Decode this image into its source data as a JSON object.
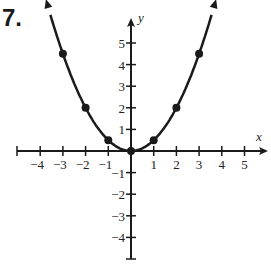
{
  "problem": {
    "number": "7."
  },
  "chart_data": {
    "type": "line",
    "title": "",
    "xlabel": "x",
    "ylabel": "y",
    "function": "y = x^2 / 2",
    "x_ticks": [
      -4,
      -3,
      -2,
      -1,
      1,
      2,
      3,
      4,
      5
    ],
    "y_ticks": [
      -4,
      -3,
      -2,
      -1,
      1,
      2,
      3,
      4,
      5
    ],
    "xlim": [
      -5,
      6
    ],
    "ylim": [
      -5,
      6
    ],
    "grid": false,
    "points": [
      {
        "x": -3,
        "y": 4.5
      },
      {
        "x": -2,
        "y": 2
      },
      {
        "x": -1,
        "y": 0.5
      },
      {
        "x": 0,
        "y": 0
      },
      {
        "x": 1,
        "y": 0.5
      },
      {
        "x": 2,
        "y": 2
      },
      {
        "x": 3,
        "y": 4.5
      }
    ],
    "curve_arrows": true,
    "colors": {
      "ink": "#1a1a1a"
    }
  },
  "axes": {
    "x_label": "x",
    "y_label": "y",
    "x_tick_labels": [
      "−4",
      "−3",
      "−2",
      "−1",
      "1",
      "2",
      "3",
      "4",
      "5"
    ],
    "y_tick_labels": [
      "5",
      "4",
      "3",
      "2",
      "1",
      "−1",
      "−2",
      "−3",
      "−4"
    ]
  }
}
